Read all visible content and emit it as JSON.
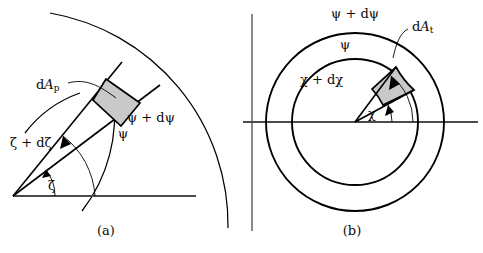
{
  "figure": {
    "title": "",
    "background_color": "#ffffff",
    "stroke_color": "#000000",
    "shaded_fill_color": "#c9c9c9",
    "axis_color": "#555555",
    "width": 483,
    "height": 253
  },
  "panel_a": {
    "caption": "(a)",
    "labels": {
      "area_element": "dAₚ",
      "area_element_main": "d",
      "area_element_symbol": "A",
      "area_element_sub": "p",
      "zeta_plus_dzeta": "ζ + dζ",
      "zeta": "ζ",
      "psi": "ψ",
      "psi_plus_dpsi": "ψ + dψ"
    },
    "geometry": {
      "origin_x": 13,
      "origin_y": 196,
      "baseline_end_x": 196,
      "ray_zeta_deg": 37,
      "ray_zeta_plus_dzeta_deg": 47,
      "arc_psi_radius": 118,
      "arc_psi_plus_dpsi_radius": 156,
      "outer_arc_radius": 215
    }
  },
  "panel_b": {
    "caption": "(b)",
    "labels": {
      "area_element": "dAₜ",
      "area_element_main": "d",
      "area_element_symbol": "A",
      "area_element_sub": "t",
      "chi_plus_dchi": "χ + dχ",
      "chi": "χ",
      "psi": "ψ",
      "psi_plus_dpsi": "ψ + dψ"
    },
    "geometry": {
      "center_x": 355,
      "center_y": 122,
      "inner_radius": 63,
      "outer_radius": 89,
      "chi_deg": 50,
      "chi_plus_dchi_deg": 68,
      "h_axis_x1": 243,
      "h_axis_x2": 478,
      "v_axis_x": 252,
      "v_axis_y1": 14,
      "v_axis_y2": 231
    }
  }
}
